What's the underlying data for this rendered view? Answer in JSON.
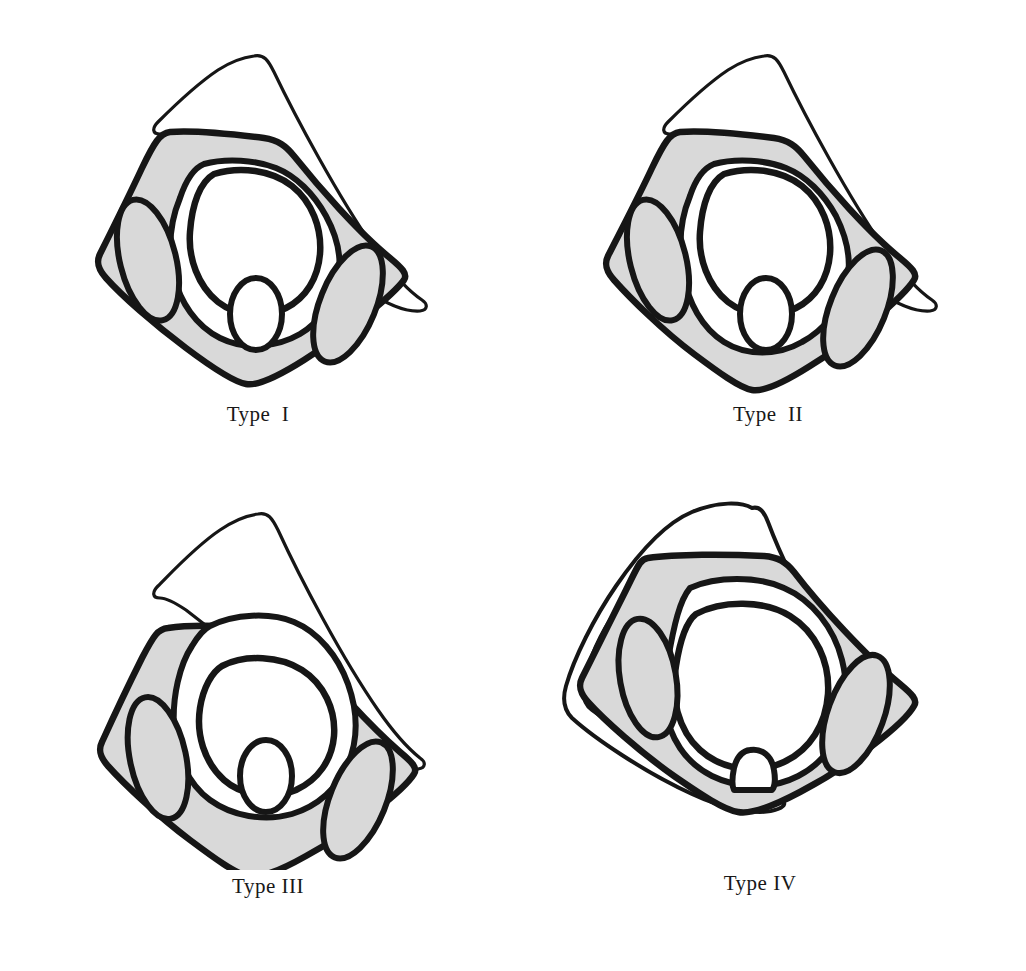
{
  "figure": {
    "background_color": "#ffffff",
    "stroke_color": "#161616",
    "fill_gray": "#d9d9d9",
    "fill_white": "#ffffff",
    "panel_count": 4
  },
  "panels": [
    {
      "id": "type-1",
      "caption": "Type  I",
      "roman": "I",
      "description": "Tall narrow cone apex high above the body; central circle large and high; small central oval sits low inside the ring.",
      "cone_apex": {
        "x": 253,
        "y": 72
      },
      "cone_height_rank": 1,
      "central_circle_size": "large",
      "central_oval_size": "small",
      "shapes": [
        {
          "name": "outer-cone",
          "fill": "#ffffff"
        },
        {
          "name": "body-diamond",
          "fill": "#d9d9d9"
        },
        {
          "name": "inner-ring",
          "fill": "#ffffff"
        },
        {
          "name": "central-circle",
          "fill": "#ffffff"
        },
        {
          "name": "left-ellipse",
          "fill": "#d9d9d9"
        },
        {
          "name": "right-ellipse",
          "fill": "#d9d9d9"
        },
        {
          "name": "central-oval",
          "fill": "#ffffff"
        }
      ]
    },
    {
      "id": "type-2",
      "caption": "Type  II",
      "roman": "II",
      "description": "Cone similar height to Type I; inner ring slightly dropped so the lower rim shows a second arc beneath the central oval.",
      "cone_apex": {
        "x": 750,
        "y": 72
      },
      "cone_height_rank": 1,
      "central_circle_size": "large",
      "central_oval_size": "small",
      "shapes": [
        {
          "name": "outer-cone",
          "fill": "#ffffff"
        },
        {
          "name": "body-diamond",
          "fill": "#d9d9d9"
        },
        {
          "name": "inner-ring",
          "fill": "#ffffff"
        },
        {
          "name": "central-circle",
          "fill": "#ffffff"
        },
        {
          "name": "left-ellipse",
          "fill": "#d9d9d9"
        },
        {
          "name": "right-ellipse",
          "fill": "#d9d9d9"
        },
        {
          "name": "central-oval",
          "fill": "#ffffff"
        }
      ]
    },
    {
      "id": "type-3",
      "caption": "Type III",
      "roman": "III",
      "description": "Cone shifted upward relative to the body; the body diamond rides lower so the cone rim crosses the upper inner ring.",
      "cone_apex": {
        "x": 255,
        "y": 524
      },
      "cone_height_rank": 2,
      "central_circle_size": "medium",
      "central_oval_size": "small",
      "shapes": [
        {
          "name": "outer-cone",
          "fill": "#ffffff"
        },
        {
          "name": "body-diamond",
          "fill": "#d9d9d9"
        },
        {
          "name": "inner-ring",
          "fill": "#ffffff"
        },
        {
          "name": "central-circle",
          "fill": "#ffffff"
        },
        {
          "name": "left-ellipse",
          "fill": "#d9d9d9"
        },
        {
          "name": "right-ellipse",
          "fill": "#d9d9d9"
        },
        {
          "name": "central-oval",
          "fill": "#ffffff"
        }
      ]
    },
    {
      "id": "type-4",
      "caption": "Type IV",
      "roman": "IV",
      "description": "Short stubby cone; the body is broad and the central circle is much larger, reducing the inner ring to a thin band; the tiny central oval is pushed to the bottom rim.",
      "cone_apex": {
        "x": 740,
        "y": 518
      },
      "cone_height_rank": 4,
      "central_circle_size": "very-large",
      "central_oval_size": "tiny",
      "shapes": [
        {
          "name": "outer-cone",
          "fill": "#ffffff"
        },
        {
          "name": "body-diamond",
          "fill": "#d9d9d9"
        },
        {
          "name": "inner-ring",
          "fill": "#ffffff"
        },
        {
          "name": "central-circle",
          "fill": "#ffffff"
        },
        {
          "name": "left-ellipse",
          "fill": "#d9d9d9"
        },
        {
          "name": "right-ellipse",
          "fill": "#d9d9d9"
        },
        {
          "name": "central-oval",
          "fill": "#ffffff"
        }
      ]
    }
  ]
}
